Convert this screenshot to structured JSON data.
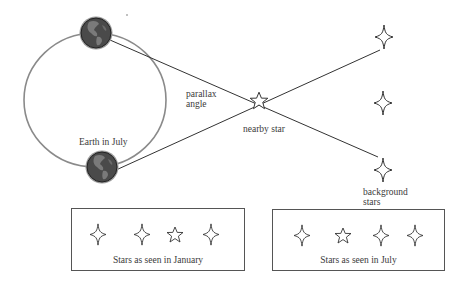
{
  "diagram": {
    "labels": {
      "parallax_angle_line1": "parallax",
      "parallax_angle_line2": "angle",
      "earth_july": "Earth in July",
      "nearby_star": "nearby star",
      "background_stars_line1": "background",
      "background_stars_line2": "stars"
    },
    "panels": [
      {
        "label": "Stars as seen in January",
        "sequence": [
          "background-star",
          "background-star",
          "nearby-star",
          "background-star"
        ]
      },
      {
        "label": "Stars as seen in July",
        "sequence": [
          "background-star",
          "nearby-star",
          "background-star",
          "background-star"
        ]
      }
    ],
    "icons": {
      "earth": "earth-globe-icon",
      "nearby_star": "five-point-star-outline",
      "background_star": "four-point-sparkle-outline"
    },
    "colors": {
      "line": "#333333",
      "orbit": "#8a8a8a",
      "earth_fill": "#4a4a4a",
      "box_border": "#555555"
    }
  }
}
